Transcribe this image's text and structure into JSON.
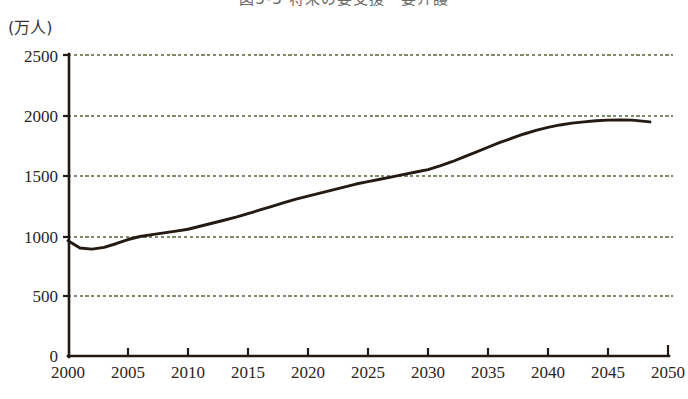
{
  "figure": {
    "title": "図3-3 将来の要支援・要介護",
    "title_note": "cut off at top edge of screenshot",
    "unit_label": "(万人)"
  },
  "chart_data": {
    "type": "line",
    "title": "図3-3 将来の要支援・要介護",
    "xlabel": "",
    "ylabel": "(万人)",
    "xlim": [
      2000,
      2050
    ],
    "ylim": [
      0,
      2500
    ],
    "grid": true,
    "grid_style": "dotted",
    "grid_color": "#7f8a6a",
    "legend": "none",
    "line_color": "#2b1f18",
    "x_ticks": [
      2000,
      2005,
      2010,
      2015,
      2020,
      2025,
      2030,
      2035,
      2040,
      2045,
      2050
    ],
    "y_ticks": [
      0,
      500,
      1000,
      1500,
      2000,
      2500
    ],
    "series": [
      {
        "name": "要支援・要介護認定者数",
        "x": [
          2000,
          2001,
          2002,
          2003,
          2004,
          2005,
          2006,
          2007,
          2008,
          2009,
          2010,
          2011,
          2012,
          2013,
          2014,
          2015,
          2016,
          2017,
          2018,
          2019,
          2020,
          2021,
          2022,
          2023,
          2024,
          2025,
          2026,
          2027,
          2028,
          2029,
          2030,
          2031,
          2032,
          2033,
          2034,
          2035,
          2036,
          2037,
          2038,
          2039,
          2040,
          2041,
          2042,
          2043,
          2044,
          2045,
          2046,
          2047,
          2048.5
        ],
        "values": [
          960,
          900,
          890,
          905,
          935,
          970,
          995,
          1010,
          1025,
          1040,
          1055,
          1080,
          1105,
          1130,
          1155,
          1185,
          1215,
          1245,
          1275,
          1305,
          1330,
          1355,
          1380,
          1405,
          1430,
          1450,
          1470,
          1490,
          1510,
          1530,
          1550,
          1580,
          1615,
          1655,
          1695,
          1735,
          1775,
          1810,
          1845,
          1875,
          1900,
          1920,
          1935,
          1945,
          1955,
          1960,
          1962,
          1960,
          1945
        ]
      }
    ]
  },
  "axis": {
    "y_tick_labels": [
      "2500",
      "2000",
      "1500",
      "1000",
      "500",
      "0"
    ],
    "x_tick_labels": [
      "2000",
      "2005",
      "2010",
      "2015",
      "2020",
      "2025",
      "2030",
      "2035",
      "2040",
      "2045",
      "2050"
    ]
  }
}
